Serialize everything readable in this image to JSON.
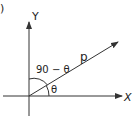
{
  "figure": {
    "corner_mark": ")",
    "axes": {
      "x_label": "X",
      "y_label": "Y"
    },
    "vector": {
      "label": "p"
    },
    "angles": {
      "from_y_axis": "90 − θ",
      "from_x_axis": "θ"
    },
    "colors": {
      "stroke": "#333333",
      "background": "#ffffff"
    }
  }
}
